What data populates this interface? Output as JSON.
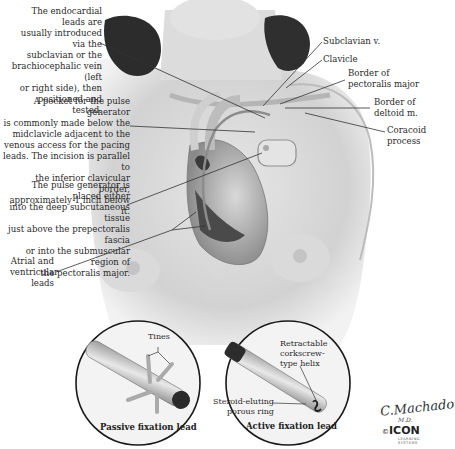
{
  "figure": {
    "callouts_left": [
      {
        "id": "endocardial-leads",
        "text": "The endocardial leads are usually introduced via the subclavian or the brachiocephalic vein (left or right side), then positioned and tested.",
        "lines": [
          "The endocardial leads are",
          "usually introduced via the",
          "subclavian or the",
          "brachiocephalic vein (left",
          "or right side), then",
          "positioned and tested."
        ]
      },
      {
        "id": "pulse-generator-pocket",
        "text": "A pocket for the pulse generator is commonly made below the midclavicle adjacent to the venous access for the pacing leads. The incision is parallel to the inferior clavicular border, approximately 1 inch below it.",
        "lines": [
          "A pocket for the pulse generator",
          "is commonly made below the",
          "midclavicle adjacent to the",
          "venous access for the pacing",
          "leads. The incision is parallel to",
          "the inferior clavicular border,",
          "approximately 1 inch below it."
        ]
      },
      {
        "id": "pulse-generator-placement",
        "text": "The pulse generator is placed either into the deep subcutaneous tissue just above the prepectoralis fascia or into the submuscular region of the pectoralis major.",
        "lines": [
          "The pulse generator is placed either",
          "into the deep subcutaneous tissue",
          "just above the prepectoralis fascia",
          "or into the submuscular region of",
          "the pectoralis major."
        ]
      },
      {
        "id": "atrial-ventricular-leads",
        "text": "Atrial and ventricular leads",
        "lines": [
          "Atrial and",
          "ventricular",
          "leads"
        ]
      }
    ],
    "callouts_right": [
      {
        "id": "subclavian-v",
        "lines": [
          "Subclavian v."
        ]
      },
      {
        "id": "clavicle",
        "lines": [
          "Clavicle"
        ]
      },
      {
        "id": "border-pectoralis",
        "lines": [
          "Border of",
          "pectoralis major"
        ]
      },
      {
        "id": "border-deltoid",
        "lines": [
          "Border of",
          "deltoid m."
        ]
      },
      {
        "id": "coracoid",
        "lines": [
          "Coracoid",
          "process"
        ]
      }
    ],
    "insets": [
      {
        "id": "passive",
        "caption": "Passive fixation lead",
        "labels": [
          "Tines"
        ]
      },
      {
        "id": "active",
        "caption": "Active fixation lead",
        "labels": [
          "Retractable",
          "corkscrew-",
          "type helix",
          "Steroid-eluting",
          "porous ring"
        ]
      }
    ],
    "signature": {
      "name": "C.Machado",
      "suffix": "M.D.",
      "copyright": "©",
      "logo": "ICON",
      "logo_sub": "LEARNING SYSTEMS"
    }
  }
}
